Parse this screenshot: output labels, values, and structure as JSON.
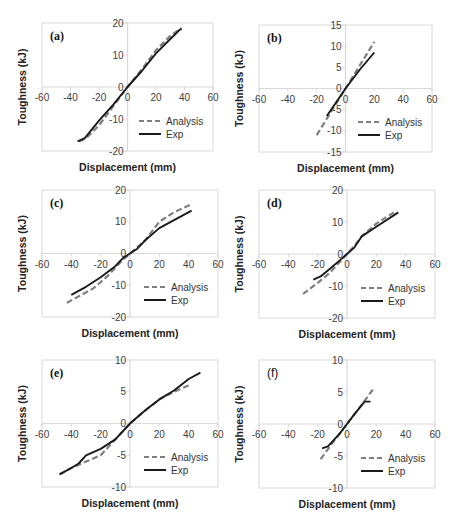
{
  "figure": {
    "xlabel": "Displacement (mm)",
    "ylabel": "Toughness (kJ)",
    "legend": {
      "analysis": "Analysis",
      "exp": "Exp"
    },
    "colors": {
      "analysis": "#7f7f7f",
      "exp": "#1a1a1a",
      "axis": "#d9d9d9",
      "frame": "#d9d9d9"
    }
  },
  "chart_data": [
    {
      "type": "line",
      "panel": "(a)",
      "xlabel": "Displacement (mm)",
      "ylabel": "Toughness (kJ)",
      "xlim": [
        -60,
        60
      ],
      "ylim": [
        -20,
        20
      ],
      "xticks": [
        -60,
        -40,
        -20,
        0,
        20,
        40,
        60
      ],
      "yticks": [
        -20,
        -10,
        0,
        10,
        20
      ],
      "legend_position": "lower right",
      "series": [
        {
          "name": "Analysis",
          "style": "dashed",
          "x": [
            -34,
            -29,
            -20,
            -10,
            0,
            10,
            20,
            30,
            38
          ],
          "y": [
            -17,
            -16,
            -12,
            -6,
            0,
            5.5,
            11.5,
            16,
            18.5
          ]
        },
        {
          "name": "Exp",
          "style": "solid",
          "x": [
            -35,
            -30,
            -20,
            -10,
            0,
            10,
            20,
            30,
            37,
            38
          ],
          "y": [
            -17,
            -16,
            -10.5,
            -5.5,
            0,
            5,
            10.5,
            15,
            18,
            18
          ]
        }
      ]
    },
    {
      "type": "line",
      "panel": "(b)",
      "xlabel": "Displacement (mm)",
      "ylabel": "Toughness (kJ)",
      "xlim": [
        -60,
        60
      ],
      "ylim": [
        -15,
        15
      ],
      "xticks": [
        -60,
        -40,
        -20,
        0,
        20,
        40,
        60
      ],
      "yticks": [
        -15,
        -10,
        -5,
        0,
        5,
        10,
        15
      ],
      "legend_position": "lower right",
      "series": [
        {
          "name": "Analysis",
          "style": "dashed",
          "x": [
            -20,
            -10,
            0,
            10,
            20
          ],
          "y": [
            -11,
            -5.5,
            0,
            5.5,
            11
          ]
        },
        {
          "name": "Exp",
          "style": "solid",
          "x": [
            -13,
            -6,
            0,
            10,
            20
          ],
          "y": [
            -6.5,
            -3,
            0,
            4.5,
            8.5
          ]
        }
      ]
    },
    {
      "type": "line",
      "panel": "(c)",
      "xlabel": "Displacement (mm)",
      "ylabel": "Toughness (kJ)",
      "xlim": [
        -60,
        60
      ],
      "ylim": [
        -20,
        20
      ],
      "xticks": [
        -60,
        -40,
        -20,
        0,
        20,
        40,
        60
      ],
      "yticks": [
        -20,
        -10,
        0,
        10,
        20
      ],
      "legend_position": "lower right",
      "series": [
        {
          "name": "Analysis",
          "style": "dashed",
          "x": [
            -43,
            -35,
            -25,
            -15,
            -5,
            0,
            10,
            20,
            30,
            42
          ],
          "y": [
            -15.5,
            -13.5,
            -11,
            -7,
            -2,
            0,
            4,
            10,
            13,
            15.5
          ]
        },
        {
          "name": "Exp",
          "style": "solid",
          "x": [
            -40,
            -30,
            -20,
            -10,
            -5,
            0,
            5,
            10,
            20,
            30,
            42
          ],
          "y": [
            -13,
            -10.5,
            -7.5,
            -4,
            -1.5,
            0,
            1.5,
            4,
            8,
            10.5,
            13.5
          ]
        }
      ]
    },
    {
      "type": "line",
      "panel": "(d)",
      "xlabel": "Displacement (mm)",
      "ylabel": "Toughness (kJ)",
      "xlim": [
        -60,
        60
      ],
      "ylim": [
        -20,
        20
      ],
      "xticks": [
        -60,
        -40,
        -20,
        0,
        20,
        40,
        60
      ],
      "yticks": [
        -20,
        -10,
        0,
        10,
        20
      ],
      "legend_position": "lower right",
      "series": [
        {
          "name": "Analysis",
          "style": "dashed",
          "x": [
            -30,
            -20,
            -12,
            -5,
            0,
            5,
            10,
            20,
            32
          ],
          "y": [
            -12.5,
            -9,
            -6,
            -2.5,
            0,
            2.5,
            5.5,
            9.5,
            13
          ]
        },
        {
          "name": "Exp",
          "style": "solid",
          "x": [
            -23,
            -18,
            -10,
            -5,
            0,
            5,
            10,
            20,
            35
          ],
          "y": [
            -8,
            -7,
            -4,
            -2,
            0,
            2,
            5.5,
            8.5,
            13
          ]
        }
      ]
    },
    {
      "type": "line",
      "panel": "(e)",
      "xlabel": "Displacement (mm)",
      "ylabel": "Toughness (kJ)",
      "xlim": [
        -60,
        60
      ],
      "ylim": [
        -10,
        10
      ],
      "xticks": [
        -60,
        -40,
        -20,
        0,
        20,
        40,
        60
      ],
      "yticks": [
        -10,
        -5,
        0,
        5,
        10
      ],
      "legend_position": "lower right",
      "series": [
        {
          "name": "Analysis",
          "style": "dashed",
          "x": [
            -48,
            -40,
            -35,
            -30,
            -20,
            -10,
            0,
            10,
            20,
            30,
            40
          ],
          "y": [
            -8,
            -7,
            -6.5,
            -6,
            -5,
            -2.5,
            0,
            2,
            3.8,
            5,
            6
          ]
        },
        {
          "name": "Exp",
          "style": "solid",
          "x": [
            -48,
            -40,
            -35,
            -30,
            -20,
            -10,
            0,
            10,
            20,
            30,
            40,
            48
          ],
          "y": [
            -8,
            -7,
            -6.3,
            -5,
            -4,
            -2.5,
            0,
            2,
            3.8,
            5.2,
            7,
            8
          ]
        }
      ]
    },
    {
      "type": "line",
      "panel": "(f)",
      "xlabel": "Displacement (mm)",
      "ylabel": "Toughness (kJ)",
      "xlim": [
        -60,
        60
      ],
      "ylim": [
        -10,
        10
      ],
      "xticks": [
        -60,
        -40,
        -20,
        0,
        20,
        40,
        60
      ],
      "yticks": [
        -10,
        -5,
        0,
        5,
        10
      ],
      "legend_position": "lower right",
      "series": [
        {
          "name": "Analysis",
          "style": "dashed",
          "x": [
            -18,
            -10,
            0,
            10,
            18
          ],
          "y": [
            -5.5,
            -3,
            0,
            3,
            5.5
          ]
        },
        {
          "name": "Exp",
          "style": "solid",
          "x": [
            -17,
            -13,
            -5,
            0,
            5,
            12,
            16
          ],
          "y": [
            -3.8,
            -3.5,
            -1.5,
            0,
            1.5,
            3.5,
            3.5
          ]
        }
      ]
    }
  ]
}
